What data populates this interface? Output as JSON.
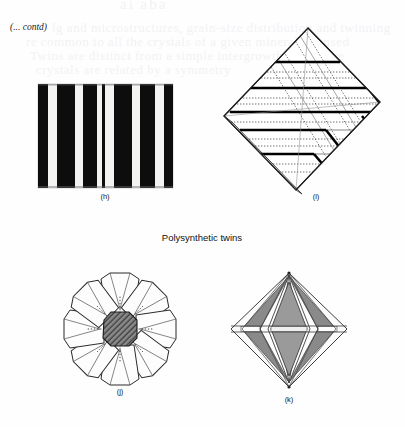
{
  "page": {
    "width": 405,
    "height": 427,
    "background": "#fefefe",
    "continuation_note": "(... contd)",
    "bleed_through": {
      "top": "ai aba",
      "line1": "lg and microstructures, grain-size distribution and twinning",
      "line2": "re common to all the crystals of a given mineral are used",
      "line3": "Twins are distinct from a simple intergrowth in that the",
      "line4": "crystals are related by a symmetry"
    }
  },
  "section": {
    "title": "Polysynthetic twins"
  },
  "figures": [
    {
      "id": "h",
      "caption": "(h)",
      "name": "polysynthetic-lamellae-block",
      "type": "striped-rectangle",
      "colors": {
        "stripe_dark": "#0d0d0d",
        "stripe_light": "#f3f3f1",
        "border": "#c9c9c9"
      },
      "stripes_light": [
        {
          "x": 10,
          "w": 9
        },
        {
          "x": 37,
          "w": 8
        },
        {
          "x": 59,
          "w": 5
        },
        {
          "x": 67,
          "w": 9
        },
        {
          "x": 94,
          "w": 8
        },
        {
          "x": 117,
          "w": 9
        }
      ],
      "box": {
        "x": 0,
        "y": 0,
        "w": 135,
        "h": 104
      }
    },
    {
      "id": "i",
      "caption": "(i)",
      "name": "rhombic-polysynthetic-twin-diagram",
      "type": "rhomb-lamellae-3d",
      "colors": {
        "solid": "#000000",
        "thin": "#3a3a3a",
        "dotted": "#555555",
        "face": "#ffffff"
      }
    },
    {
      "id": "j",
      "caption": "(j)",
      "name": "cyclic-twin-rosette",
      "type": "eight-fold-star-rosette",
      "colors": {
        "outline": "#2b2b2b",
        "face": "#fdfdfd",
        "core_fill": "#5a5a5a",
        "dotted": "#3a3a3a"
      },
      "petals": 8
    },
    {
      "id": "k",
      "caption": "(k)",
      "name": "bipyramid-twin-diagram",
      "type": "bipyramid",
      "colors": {
        "outline": "#3d3d3d",
        "face_gray": "#8a8a8a",
        "face_light": "#fbfbfb",
        "face_mid": "#9a9a9a"
      }
    }
  ]
}
